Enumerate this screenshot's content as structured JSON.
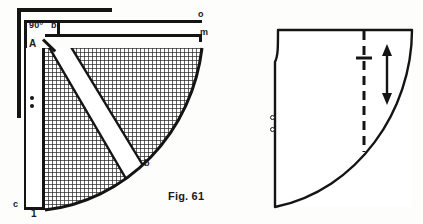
{
  "figure": {
    "caption": "Fig. 61",
    "colors": {
      "ink": "#141414",
      "paper": "#fdfdfc",
      "hatch": "#3a3a3a"
    }
  },
  "left_diagram": {
    "name": "skirt-sloper-construction-draft",
    "labels": {
      "right_angle": "90°",
      "point_b": "b",
      "point_A": "A",
      "point_o": "o",
      "point_m": "m",
      "point_c": "c",
      "point_1": "1",
      "point_arc": "b"
    },
    "notches": [
      {
        "id": "notch-upper"
      },
      {
        "id": "notch-lower"
      }
    ]
  },
  "right_diagram": {
    "name": "finished-pattern-piece",
    "grainline": "grainline-dashed",
    "grain_arrow": "double-headed-arrow",
    "cross_mark": "plus-mark",
    "notches": [
      {
        "id": "notch-upper"
      },
      {
        "id": "notch-lower"
      }
    ]
  }
}
